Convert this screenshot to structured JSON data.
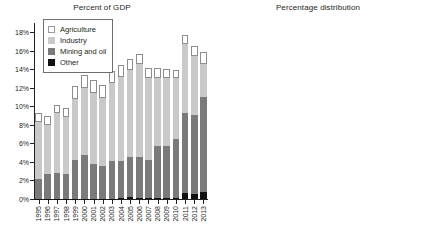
{
  "legend": {
    "items": [
      {
        "key": "agriculture",
        "label": "Agriculture",
        "color": "#ffffff"
      },
      {
        "key": "industry",
        "label": "Industry",
        "color": "#c9c9c9"
      },
      {
        "key": "mining",
        "label": "Mining and oil",
        "color": "#7a7a7a"
      },
      {
        "key": "other",
        "label": "Other",
        "color": "#111111"
      }
    ]
  },
  "chart_data": [
    {
      "id": "percent-of-gdp",
      "type": "bar",
      "stacked": true,
      "title": "Percent of GDP",
      "xlabel": "",
      "ylabel": "",
      "ylim": [
        0,
        19
      ],
      "yticks": [
        0,
        2,
        4,
        6,
        8,
        10,
        12,
        14,
        16,
        18
      ],
      "ytick_labels": [
        "0%",
        "2%",
        "4%",
        "6%",
        "8%",
        "10%",
        "12%",
        "14%",
        "16%",
        "18%"
      ],
      "grid": false,
      "legend_position": "upper-left",
      "categories": [
        "1995",
        "1996",
        "1997",
        "1998",
        "1999",
        "2000",
        "2001",
        "2002",
        "2003",
        "2004",
        "2005",
        "2006",
        "2007",
        "2008",
        "2009",
        "2010",
        "2011",
        "2012",
        "2013"
      ],
      "series": [
        {
          "name": "Other",
          "color": "#111111",
          "values": [
            0.05,
            0.05,
            0.05,
            0.05,
            0.05,
            0.05,
            0.05,
            0.05,
            0.05,
            0.15,
            0.2,
            0.15,
            0.1,
            0.1,
            0.1,
            0.1,
            0.6,
            0.5,
            0.75
          ]
        },
        {
          "name": "Mining and oil",
          "color": "#7a7a7a",
          "values": [
            2.15,
            2.7,
            2.75,
            2.65,
            4.15,
            4.75,
            3.7,
            3.5,
            4.05,
            3.95,
            4.3,
            4.4,
            4.1,
            5.6,
            5.65,
            6.4,
            8.7,
            8.55,
            10.3
          ]
        },
        {
          "name": "Industry",
          "color": "#c9c9c9",
          "values": [
            6.1,
            5.25,
            6.45,
            6.2,
            6.6,
            7.15,
            7.65,
            7.4,
            8.45,
            9.1,
            9.4,
            10.0,
            8.9,
            7.4,
            7.3,
            6.6,
            7.45,
            6.4,
            3.5
          ]
        },
        {
          "name": "Agriculture",
          "color": "#ffffff",
          "values": [
            0.95,
            1.0,
            0.95,
            0.95,
            1.45,
            1.45,
            1.4,
            1.35,
            1.3,
            1.25,
            1.2,
            1.15,
            1.0,
            1.05,
            0.95,
            0.85,
            0.95,
            1.1,
            1.3
          ]
        }
      ],
      "annotations": []
    },
    {
      "id": "percentage-distribution",
      "type": "bar",
      "stacked": true,
      "normalized": true,
      "title": "Percentage distribution",
      "xlabel": "",
      "ylabel": "",
      "ylim": [
        0,
        100
      ],
      "yticks": [
        0,
        10,
        20,
        30,
        40,
        50,
        60,
        70,
        80,
        90,
        100
      ],
      "ytick_labels": [
        "0%",
        "10%",
        "20%",
        "30%",
        "40%",
        "50%",
        "60%",
        "70%",
        "80%",
        "90%",
        "100%"
      ],
      "grid": false,
      "legend_position": "none",
      "categories": [
        "1995",
        "1996",
        "1997",
        "1998",
        "1999",
        "2000",
        "2001",
        "2002",
        "2003",
        "2004",
        "2005",
        "2006",
        "2007",
        "2008",
        "2009",
        "2010",
        "2011",
        "2012",
        "2013"
      ],
      "series": [
        {
          "name": "Other",
          "color": "#111111",
          "values": [
            0.5,
            0.5,
            0.5,
            0.5,
            0.5,
            0.5,
            0.5,
            0.5,
            0.5,
            1.2,
            1.5,
            1.0,
            0.8,
            0.8,
            0.7,
            0.7,
            4.0,
            3.2,
            4.5
          ]
        },
        {
          "name": "Mining and oil",
          "color": "#7a7a7a",
          "values": [
            23.5,
            30.0,
            26.9,
            26.6,
            34.8,
            36.2,
            29.5,
            29.2,
            28.8,
            28.0,
            30.0,
            29.5,
            28.8,
            36.2,
            40.8,
            47.0,
            51.0,
            52.8,
            63.5
          ]
        },
        {
          "name": "Industry",
          "color": "#c9c9c9",
          "values": [
            66.0,
            60.0,
            63.3,
            62.4,
            55.8,
            54.5,
            61.0,
            61.4,
            62.0,
            63.0,
            61.5,
            62.0,
            63.5,
            55.8,
            52.5,
            46.5,
            40.0,
            37.0,
            21.0
          ]
        },
        {
          "name": "Agriculture",
          "color": "#ffffff",
          "values": [
            10.0,
            9.5,
            9.3,
            10.5,
            8.9,
            8.8,
            9.0,
            8.9,
            8.7,
            7.8,
            7.0,
            7.5,
            6.9,
            7.2,
            6.0,
            5.8,
            5.0,
            7.0,
            11.0
          ]
        }
      ],
      "annotations": [
        {
          "text": "10%",
          "category": "1995",
          "x_pct": 8,
          "y_pct": 93,
          "anchor": "left"
        },
        {
          "text": "9%",
          "category": "1999",
          "x_pct": 32,
          "y_pct": 93,
          "anchor": "left"
        },
        {
          "text": "8%",
          "category": "2003",
          "x_pct": 56,
          "y_pct": 93,
          "anchor": "left"
        },
        {
          "text": "5%",
          "category": "2010",
          "x_pct": 80,
          "y_pct": 93,
          "anchor": "left"
        },
        {
          "text": "11%",
          "category": "2012",
          "x_pct": 89,
          "y_pct": 89.5,
          "anchor": "left"
        },
        {
          "text": "17%",
          "category": "2013",
          "x_pct": 87,
          "y_pct": 77,
          "anchor": "left"
        },
        {
          "text": "46%",
          "category": "2010",
          "x_pct": 74,
          "y_pct": 68,
          "anchor": "left"
        },
        {
          "text": "60%",
          "category": "2003",
          "x_pct": 54,
          "y_pct": 58.5,
          "anchor": "left"
        },
        {
          "text": "54%",
          "category": "1999",
          "x_pct": 30,
          "y_pct": 54,
          "anchor": "left"
        },
        {
          "text": "65%",
          "category": "1995",
          "x_pct": 1,
          "y_pct": 48.5,
          "anchor": "left"
        },
        {
          "text": "68%",
          "category": "2012",
          "x_pct": 85,
          "y_pct": 28,
          "anchor": "left"
        },
        {
          "text": "48%",
          "category": "2010",
          "x_pct": 70,
          "y_pct": 13,
          "anchor": "left"
        },
        {
          "text": "31%",
          "category": "2004",
          "x_pct": 50,
          "y_pct": 12,
          "anchor": "left"
        },
        {
          "text": "37%",
          "category": "1999",
          "x_pct": 29,
          "y_pct": 13,
          "anchor": "left"
        },
        {
          "text": "25%",
          "category": "1995",
          "x_pct": 1,
          "y_pct": 6,
          "anchor": "left"
        }
      ]
    }
  ]
}
